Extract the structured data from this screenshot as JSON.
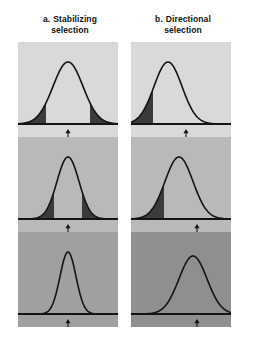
{
  "figure": {
    "title_a_label": "a.",
    "title_a_line1": "Stabilizing",
    "title_a_line2": "selection",
    "title_b_label": "b.",
    "title_b_line1": "Directional",
    "title_b_line2": "selection",
    "colors": {
      "page_background": "#ffffff",
      "curve_line": "#141414",
      "baseline": "#141414",
      "shaded_tail": "#3b3b3b",
      "arrow": "#141414",
      "panel_row_1": "#d9d9d9",
      "panel_row_2": "#b9b9b9",
      "panel_row_3": "#a0a0a0",
      "panel_b_row_3": "#8f8f8f"
    }
  },
  "chart_data": {
    "type": "line",
    "xlabel": "",
    "ylabel": "",
    "panels": [
      {
        "id": "a",
        "label": "a.",
        "name": "Stabilizing selection",
        "generations": [
          {
            "row": 1,
            "mean": 50,
            "sd": 15,
            "peak_height": 62,
            "shaded": "both-tails",
            "shade_left_to": 28,
            "shade_right_from": 72,
            "arrow_x": 50,
            "background": "#d9d9d9"
          },
          {
            "row": 2,
            "mean": 50,
            "sd": 11,
            "peak_height": 62,
            "shaded": "both-tails",
            "shade_left_to": 36,
            "shade_right_from": 64,
            "arrow_x": 50,
            "background": "#b9b9b9"
          },
          {
            "row": 3,
            "mean": 50,
            "sd": 8,
            "peak_height": 62,
            "shaded": "none",
            "arrow_x": 50,
            "background": "#a0a0a0"
          }
        ]
      },
      {
        "id": "b",
        "label": "b.",
        "name": "Directional selection",
        "generations": [
          {
            "row": 1,
            "mean": 37,
            "sd": 14,
            "peak_height": 62,
            "shaded": "left-tail",
            "shade_left_to": 22,
            "arrow_x": 55,
            "background": "#d9d9d9"
          },
          {
            "row": 2,
            "mean": 48,
            "sd": 14,
            "peak_height": 62,
            "shaded": "left-tail",
            "shade_left_to": 33,
            "arrow_x": 66,
            "background": "#b9b9b9"
          },
          {
            "row": 3,
            "mean": 62,
            "sd": 14,
            "peak_height": 58,
            "shaded": "none",
            "arrow_x": 66,
            "background": "#8f8f8f"
          }
        ]
      }
    ]
  }
}
